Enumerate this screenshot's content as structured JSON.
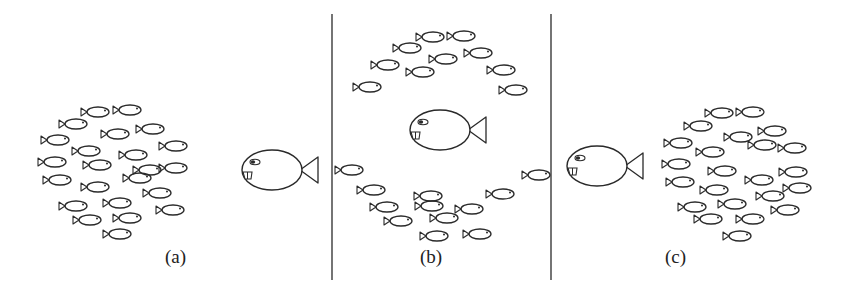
{
  "figure": {
    "panels": [
      {
        "id": "a",
        "label": "(a)",
        "label_pos": [
          165,
          254
        ],
        "predator": {
          "x": 272,
          "y": 170,
          "rx": 30,
          "ry": 20,
          "facing": "left"
        },
        "school_shape": "compact circle",
        "small_fish": [
          [
            98,
            112
          ],
          [
            130,
            110
          ],
          [
            76,
            124
          ],
          [
            118,
            134
          ],
          [
            153,
            129
          ],
          [
            58,
            140
          ],
          [
            89,
            151
          ],
          [
            136,
            155
          ],
          [
            176,
            146
          ],
          [
            55,
            162
          ],
          [
            100,
            165
          ],
          [
            150,
            170
          ],
          [
            176,
            168
          ],
          [
            60,
            180
          ],
          [
            98,
            187
          ],
          [
            140,
            178
          ],
          [
            160,
            193
          ],
          [
            76,
            206
          ],
          [
            120,
            203
          ],
          [
            173,
            210
          ],
          [
            90,
            220
          ],
          [
            130,
            218
          ],
          [
            120,
            234
          ]
        ]
      },
      {
        "id": "b",
        "label": "(b)",
        "label_pos": [
          420,
          254
        ],
        "predator": {
          "x": 440,
          "y": 130,
          "rx": 30,
          "ry": 20,
          "facing": "left"
        },
        "school_shape": "split around predator (fountain effect)",
        "small_fish": [
          [
            433,
            37
          ],
          [
            464,
            36
          ],
          [
            410,
            48
          ],
          [
            446,
            59
          ],
          [
            481,
            53
          ],
          [
            388,
            65
          ],
          [
            423,
            72
          ],
          [
            504,
            70
          ],
          [
            370,
            87
          ],
          [
            516,
            90
          ],
          [
            352,
            170
          ],
          [
            539,
            175
          ],
          [
            374,
            190
          ],
          [
            431,
            196
          ],
          [
            503,
            194
          ],
          [
            387,
            207
          ],
          [
            432,
            206
          ],
          [
            472,
            209
          ],
          [
            401,
            221
          ],
          [
            447,
            218
          ],
          [
            437,
            236
          ],
          [
            480,
            234
          ]
        ]
      },
      {
        "id": "c",
        "label": "(c)",
        "label_pos": [
          665,
          254
        ],
        "predator": {
          "x": 597,
          "y": 166,
          "rx": 30,
          "ry": 20,
          "facing": "left"
        },
        "school_shape": "compact circle (re-formed)",
        "small_fish": [
          [
            722,
            113
          ],
          [
            753,
            112
          ],
          [
            701,
            126
          ],
          [
            741,
            137
          ],
          [
            775,
            131
          ],
          [
            681,
            143
          ],
          [
            713,
            152
          ],
          [
            765,
            145
          ],
          [
            795,
            148
          ],
          [
            679,
            164
          ],
          [
            725,
            171
          ],
          [
            762,
            180
          ],
          [
            796,
            172
          ],
          [
            683,
            182
          ],
          [
            717,
            190
          ],
          [
            773,
            196
          ],
          [
            800,
            188
          ],
          [
            695,
            207
          ],
          [
            735,
            204
          ],
          [
            788,
            210
          ],
          [
            711,
            219
          ],
          [
            753,
            219
          ],
          [
            740,
            236
          ]
        ]
      }
    ],
    "separators": [
      {
        "x": 332,
        "y1": 14,
        "y2": 280
      },
      {
        "x": 551,
        "y1": 14,
        "y2": 280
      }
    ],
    "colors": {
      "stroke": "#2a2a2a",
      "background": "#ffffff"
    }
  }
}
